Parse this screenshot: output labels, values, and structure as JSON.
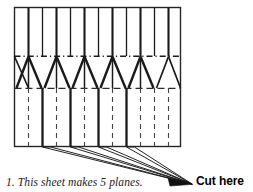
{
  "figure": {
    "caption": "1. This sheet makes 5 planes.",
    "cut_label": "Cut here",
    "plane_count": 5,
    "colors": {
      "ink": "#1a1a1a",
      "line_thin": "#3a3a3a",
      "background": "#ffffff"
    },
    "sheet": {
      "left": 14,
      "top": 7,
      "right": 181,
      "bottom": 147,
      "fold_line_y": 56,
      "nose_base_y": 88
    },
    "legend": {
      "solid_thick": "cut line",
      "dashed": "fold line",
      "dash_dot": "fold line"
    },
    "cut_lines_x": [
      14,
      28,
      42,
      56,
      70,
      84,
      98,
      112,
      126,
      140,
      154,
      168,
      181
    ],
    "bottom_thick_x": [
      42,
      70,
      98,
      126
    ],
    "bottom_dashed_x": [
      28,
      56,
      84,
      112,
      140,
      154,
      168
    ],
    "leader_target": {
      "x": 192,
      "y": 184
    }
  }
}
